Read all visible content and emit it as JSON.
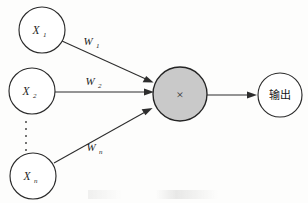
{
  "figure": {
    "background_color": "#fdfdfc",
    "stroke_color": "#2d2d2d",
    "sum_node_fill": "#c9c9c9",
    "node_fill": "#ffffff"
  },
  "inputs": [
    {
      "id": "x1",
      "base": "X",
      "subscript": "1",
      "label": "X₁",
      "cx": 42,
      "cy": 30,
      "r": 23
    },
    {
      "id": "x2",
      "base": "X",
      "subscript": "2",
      "label": "X₂",
      "cx": 32,
      "cy": 91,
      "r": 23
    },
    {
      "id": "xn",
      "base": "X",
      "subscript": "n",
      "label": "Xₙ",
      "cx": 33,
      "cy": 176,
      "r": 23
    }
  ],
  "ellipsis": {
    "name": "vertical-ellipsis",
    "dot_count": 5,
    "x": 26,
    "y_start": 122,
    "y_step": 7
  },
  "weights": [
    {
      "id": "w1",
      "base": "W",
      "subscript": "1",
      "label": "W₁",
      "x": 90,
      "y": 44
    },
    {
      "id": "w2",
      "base": "W",
      "subscript": "2",
      "label": "W₂",
      "x": 92,
      "y": 84
    },
    {
      "id": "wn",
      "base": "W",
      "subscript": "n",
      "label": "Wₙ",
      "x": 93,
      "y": 150
    }
  ],
  "sum_node": {
    "id": "sum",
    "glyph": "×",
    "glyph_name": "multiplication-cross",
    "cx": 180,
    "cy": 94,
    "r": 27
  },
  "output_node": {
    "id": "output",
    "label": "输出",
    "cx": 280,
    "cy": 95,
    "r": 22
  },
  "edges": [
    {
      "id": "edge-x1",
      "from": "x1",
      "to": "sum"
    },
    {
      "id": "edge-x2",
      "from": "x2",
      "to": "sum"
    },
    {
      "id": "edge-xn",
      "from": "xn",
      "to": "sum"
    },
    {
      "id": "edge-out",
      "from": "sum",
      "to": "output"
    }
  ]
}
